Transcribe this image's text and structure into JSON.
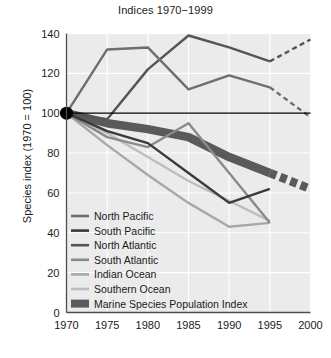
{
  "chart_data": {
    "type": "line",
    "title": "Indices 1970−1999",
    "xlabel": "",
    "ylabel": "Species index (1970 = 100)",
    "xlim": [
      1970,
      2000
    ],
    "ylim": [
      0,
      140
    ],
    "xticks": [
      1970,
      1975,
      1980,
      1985,
      1990,
      1995,
      2000
    ],
    "yticks": [
      0,
      20,
      40,
      60,
      80,
      100,
      120,
      140
    ],
    "xtick_labels": [
      "1970",
      "1975",
      "1980",
      "1985",
      "1990",
      "1995",
      "2000"
    ],
    "ytick_labels": [
      "0",
      "20",
      "40",
      "60",
      "80",
      "100",
      "120",
      "140"
    ],
    "grid": true,
    "grid_color": "#ffffff",
    "plot_background": "#ebebeb",
    "reference_line": {
      "y": 100,
      "color": "#000000"
    },
    "origin_marker": {
      "x": 1970,
      "y": 100,
      "shape": "circle",
      "color": "#000000"
    },
    "legend_position": "lower left",
    "series": [
      {
        "name": "North Pacific",
        "color": "#6e6e6e",
        "width": 2.4,
        "x": [
          1970,
          1975,
          1980,
          1985,
          1990,
          1995
        ],
        "values": [
          100,
          132,
          133,
          112,
          119,
          113
        ],
        "dashed_x": [
          1995,
          2000
        ],
        "dashed_values": [
          113,
          98
        ]
      },
      {
        "name": "South Pacific",
        "color": "#3a3a3a",
        "width": 2.4,
        "x": [
          1970,
          1975,
          1980,
          1985,
          1990,
          1995
        ],
        "values": [
          100,
          91,
          85,
          70,
          55,
          62
        ],
        "dashed_x": [],
        "dashed_values": []
      },
      {
        "name": "North Atlantic",
        "color": "#555555",
        "width": 2.4,
        "x": [
          1970,
          1975,
          1980,
          1985,
          1990,
          1995
        ],
        "values": [
          100,
          97,
          122,
          139,
          133,
          126
        ],
        "dashed_x": [
          1995,
          2000
        ],
        "dashed_values": [
          126,
          137
        ]
      },
      {
        "name": "South Atlantic",
        "color": "#8a8a8a",
        "width": 2.4,
        "x": [
          1970,
          1975,
          1980,
          1985,
          1990,
          1995
        ],
        "values": [
          100,
          88,
          83,
          95,
          70,
          45
        ],
        "dashed_x": [],
        "dashed_values": []
      },
      {
        "name": "Indian Ocean",
        "color": "#a8a8a8",
        "width": 2.4,
        "x": [
          1970,
          1975,
          1980,
          1985,
          1990,
          1995
        ],
        "values": [
          100,
          84,
          69,
          55,
          43,
          45
        ],
        "dashed_x": [],
        "dashed_values": []
      },
      {
        "name": "Southern Ocean",
        "color": "#bdbdbd",
        "width": 2.4,
        "x": [
          1970,
          1975,
          1980,
          1985,
          1990,
          1995
        ],
        "values": [
          100,
          90,
          78,
          66,
          56,
          46
        ],
        "dashed_x": [],
        "dashed_values": []
      },
      {
        "name": "Marine Species Population Index",
        "color": "#5a5a5a",
        "width": 8.5,
        "x": [
          1970,
          1975,
          1980,
          1985,
          1990,
          1995
        ],
        "values": [
          100,
          95,
          92,
          88,
          78,
          70
        ],
        "dashed_x": [
          1995,
          2000
        ],
        "dashed_values": [
          70,
          62
        ]
      }
    ]
  },
  "legend": {
    "items": [
      {
        "label": "North Pacific"
      },
      {
        "label": "South Pacific"
      },
      {
        "label": "North Atlantic"
      },
      {
        "label": "South Atlantic"
      },
      {
        "label": "Indian Ocean"
      },
      {
        "label": "Southern Ocean"
      },
      {
        "label": "Marine Species Population Index"
      }
    ]
  }
}
